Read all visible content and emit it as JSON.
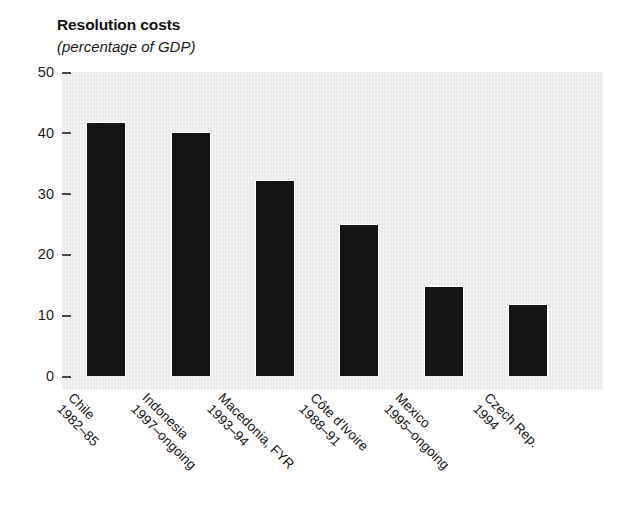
{
  "chart_data": {
    "type": "bar",
    "title": "Resolution costs",
    "subtitle": "(percentage of GDP)",
    "xlabel": "",
    "ylabel": "",
    "ylim": [
      0,
      50
    ],
    "yticks": [
      50,
      40,
      30,
      20,
      10,
      0
    ],
    "grid": false,
    "legend": "none",
    "bar_color": "#141414",
    "plot_background": "#e9e9e9",
    "categories": [
      "Chile 1982–85",
      "Indonesia 1997–ongoing",
      "Macedonia, FYR 1993–94",
      "Côte d'Ivoire 1988–91",
      "Mexico 1995–ongoing",
      "Czech Rep. 1994"
    ],
    "values": [
      41.6,
      39.9,
      32.0,
      24.8,
      14.7,
      11.7
    ],
    "bars": [
      {
        "country": "Chile",
        "period": "1982–85",
        "value": 41.6
      },
      {
        "country": "Indonesia",
        "period": "1997–ongoing",
        "value": 39.9
      },
      {
        "country": "Macedonia, FYR",
        "period": "1993–94",
        "value": 32.0
      },
      {
        "country": "Côte d'Ivoire",
        "period": "1988–91",
        "value": 24.8
      },
      {
        "country": "Mexico",
        "period": "1995–ongoing",
        "value": 14.7
      },
      {
        "country": "Czech Rep.",
        "period": "1994",
        "value": 11.7
      }
    ]
  }
}
